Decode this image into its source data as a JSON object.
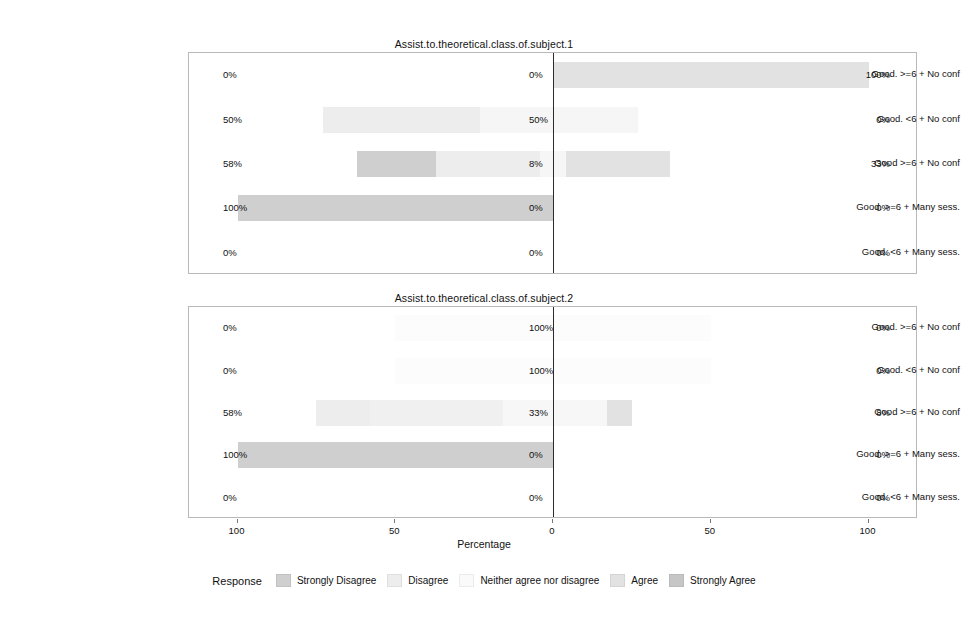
{
  "figure": {
    "axis_title": "Percentage",
    "x_ticks": [
      {
        "label": "100",
        "pos": -100
      },
      {
        "label": "50",
        "pos": -50
      },
      {
        "label": "0",
        "pos": 0
      },
      {
        "label": "50",
        "pos": 50
      },
      {
        "label": "100",
        "pos": 100
      }
    ],
    "xlim": [
      -100,
      100
    ]
  },
  "legend": {
    "title": "Response",
    "items": [
      {
        "label": "Strongly Disagree",
        "color": "#cfcfcf"
      },
      {
        "label": "Disagree",
        "color": "#ededed"
      },
      {
        "label": "Neither agree nor disagree",
        "color": "#fafafa"
      },
      {
        "label": "Agree",
        "color": "#e2e2e2"
      },
      {
        "label": "Strongly Agree",
        "color": "#c6c6c6"
      }
    ]
  },
  "categories": [
    "Good. >=6 + No conf",
    "Good. <6 + No conf",
    "Good >=6 + No conf",
    "Good. >=6 + Many sess.",
    "Good. <6 + Many sess."
  ],
  "chart_data": {
    "type": "bar",
    "subtype": "diverging-stacked-likert",
    "title": "",
    "xlabel": "Percentage",
    "ylabel": "",
    "xlim": [
      -100,
      100
    ],
    "grid": false,
    "legend_position": "bottom",
    "response_levels": [
      "Strongly Disagree",
      "Disagree",
      "Neither agree nor disagree",
      "Agree",
      "Strongly Agree"
    ],
    "panels": [
      {
        "title": "Assist.to.theoretical.class.of.subject.1",
        "categories": [
          "Good. >=6 + No conf",
          "Good. <6 + No conf",
          "Good >=6 + No conf",
          "Good. >=6 + Many sess.",
          "Good. <6 + Many sess."
        ],
        "rows": [
          {
            "category": "Good. >=6 + No conf",
            "left_label": "0%",
            "mid_label": "0%",
            "right_label": "100%",
            "segments": [
              {
                "level": "Strongly Disagree",
                "value": 0,
                "start": 0,
                "end": 0,
                "color": "#cfcfcf"
              },
              {
                "level": "Disagree",
                "value": 0,
                "start": 0,
                "end": 0,
                "color": "#ededed"
              },
              {
                "level": "Neither agree nor disagree",
                "value": 0,
                "start": 0,
                "end": 0,
                "color": "#fafafa"
              },
              {
                "level": "Agree",
                "value": 100,
                "start": 0,
                "end": 100,
                "color": "#e2e2e2"
              },
              {
                "level": "Strongly Agree",
                "value": 0,
                "start": 100,
                "end": 100,
                "color": "#c6c6c6"
              }
            ]
          },
          {
            "category": "Good. <6 + No conf",
            "left_label": "50%",
            "mid_label": "50%",
            "right_label": "0%",
            "segments": [
              {
                "level": "Strongly Disagree",
                "value": 0,
                "start": -73,
                "end": -73,
                "color": "#cfcfcf"
              },
              {
                "level": "Disagree",
                "value": 50,
                "start": -73,
                "end": -23,
                "color": "#ededed"
              },
              {
                "level": "Neither agree nor disagree",
                "value": 50,
                "start": -23,
                "end": 27,
                "color": "#f6f6f6"
              },
              {
                "level": "Agree",
                "value": 0,
                "start": 27,
                "end": 27,
                "color": "#e2e2e2"
              },
              {
                "level": "Strongly Agree",
                "value": 0,
                "start": 27,
                "end": 27,
                "color": "#c6c6c6"
              }
            ]
          },
          {
            "category": "Good >=6 + No conf",
            "left_label": "58%",
            "mid_label": "8%",
            "right_label": "33%",
            "segments": [
              {
                "level": "Strongly Disagree",
                "value": 25,
                "start": -62,
                "end": -37,
                "color": "#cfcfcf"
              },
              {
                "level": "Disagree",
                "value": 33,
                "start": -37,
                "end": -4,
                "color": "#ededed"
              },
              {
                "level": "Neither agree nor disagree",
                "value": 8,
                "start": -4,
                "end": 4,
                "color": "#f6f6f6"
              },
              {
                "level": "Agree",
                "value": 33,
                "start": 4,
                "end": 37,
                "color": "#e2e2e2"
              },
              {
                "level": "Strongly Agree",
                "value": 0,
                "start": 37,
                "end": 37,
                "color": "#c6c6c6"
              }
            ]
          },
          {
            "category": "Good. >=6 + Many sess.",
            "left_label": "100%",
            "mid_label": "0%",
            "right_label": "0%",
            "segments": [
              {
                "level": "Strongly Disagree",
                "value": 100,
                "start": -100,
                "end": 0,
                "color": "#cfcfcf"
              },
              {
                "level": "Disagree",
                "value": 0,
                "start": 0,
                "end": 0,
                "color": "#ededed"
              },
              {
                "level": "Neither agree nor disagree",
                "value": 0,
                "start": 0,
                "end": 0,
                "color": "#f6f6f6"
              },
              {
                "level": "Agree",
                "value": 0,
                "start": 0,
                "end": 0,
                "color": "#e2e2e2"
              },
              {
                "level": "Strongly Agree",
                "value": 0,
                "start": 0,
                "end": 0,
                "color": "#c6c6c6"
              }
            ]
          },
          {
            "category": "Good. <6 + Many sess.",
            "left_label": "0%",
            "mid_label": "0%",
            "right_label": "0%",
            "segments": [
              {
                "level": "Strongly Disagree",
                "value": 0,
                "start": 0,
                "end": 0,
                "color": "#cfcfcf"
              },
              {
                "level": "Disagree",
                "value": 0,
                "start": 0,
                "end": 0,
                "color": "#ededed"
              },
              {
                "level": "Neither agree nor disagree",
                "value": 0,
                "start": 0,
                "end": 0,
                "color": "#f6f6f6"
              },
              {
                "level": "Agree",
                "value": 0,
                "start": 0,
                "end": 0,
                "color": "#e2e2e2"
              },
              {
                "level": "Strongly Agree",
                "value": 0,
                "start": 0,
                "end": 0,
                "color": "#c6c6c6"
              }
            ]
          }
        ]
      },
      {
        "title": "Assist.to.theoretical.class.of.subject.2",
        "categories": [
          "Good. >=6 + No conf",
          "Good. <6 + No conf",
          "Good >=6 + No conf",
          "Good. >=6 + Many sess.",
          "Good. <6 + Many sess."
        ],
        "rows": [
          {
            "category": "Good. >=6 + No conf",
            "left_label": "0%",
            "mid_label": "100%",
            "right_label": "0%",
            "segments": [
              {
                "level": "Strongly Disagree",
                "value": 0,
                "start": -50,
                "end": -50,
                "color": "#cfcfcf"
              },
              {
                "level": "Disagree",
                "value": 0,
                "start": -50,
                "end": -50,
                "color": "#ededed"
              },
              {
                "level": "Neither agree nor disagree",
                "value": 100,
                "start": -50,
                "end": 50,
                "color": "#fcfcfc"
              },
              {
                "level": "Agree",
                "value": 0,
                "start": 50,
                "end": 50,
                "color": "#e2e2e2"
              },
              {
                "level": "Strongly Agree",
                "value": 0,
                "start": 50,
                "end": 50,
                "color": "#c6c6c6"
              }
            ]
          },
          {
            "category": "Good. <6 + No conf",
            "left_label": "0%",
            "mid_label": "100%",
            "right_label": "0%",
            "segments": [
              {
                "level": "Strongly Disagree",
                "value": 0,
                "start": -50,
                "end": -50,
                "color": "#cfcfcf"
              },
              {
                "level": "Disagree",
                "value": 0,
                "start": -50,
                "end": -50,
                "color": "#ededed"
              },
              {
                "level": "Neither agree nor disagree",
                "value": 100,
                "start": -50,
                "end": 50,
                "color": "#fcfcfc"
              },
              {
                "level": "Agree",
                "value": 0,
                "start": 50,
                "end": 50,
                "color": "#e2e2e2"
              },
              {
                "level": "Strongly Agree",
                "value": 0,
                "start": 50,
                "end": 50,
                "color": "#c6c6c6"
              }
            ]
          },
          {
            "category": "Good >=6 + No conf",
            "left_label": "58%",
            "mid_label": "33%",
            "right_label": "8%",
            "segments": [
              {
                "level": "Strongly Disagree",
                "value": 17,
                "start": -75,
                "end": -58,
                "color": "#ededed"
              },
              {
                "level": "Disagree",
                "value": 42,
                "start": -58,
                "end": -16,
                "color": "#f0f0f0"
              },
              {
                "level": "Neither agree nor disagree",
                "value": 33,
                "start": -16,
                "end": 17,
                "color": "#f7f7f7"
              },
              {
                "level": "Agree",
                "value": 8,
                "start": 17,
                "end": 25,
                "color": "#e2e2e2"
              },
              {
                "level": "Strongly Agree",
                "value": 0,
                "start": 25,
                "end": 25,
                "color": "#c6c6c6"
              }
            ]
          },
          {
            "category": "Good. >=6 + Many sess.",
            "left_label": "100%",
            "mid_label": "0%",
            "right_label": "0%",
            "segments": [
              {
                "level": "Strongly Disagree",
                "value": 100,
                "start": -100,
                "end": 0,
                "color": "#cfcfcf"
              },
              {
                "level": "Disagree",
                "value": 0,
                "start": 0,
                "end": 0,
                "color": "#ededed"
              },
              {
                "level": "Neither agree nor disagree",
                "value": 0,
                "start": 0,
                "end": 0,
                "color": "#f6f6f6"
              },
              {
                "level": "Agree",
                "value": 0,
                "start": 0,
                "end": 0,
                "color": "#e2e2e2"
              },
              {
                "level": "Strongly Agree",
                "value": 0,
                "start": 0,
                "end": 0,
                "color": "#c6c6c6"
              }
            ]
          },
          {
            "category": "Good. <6 + Many sess.",
            "left_label": "0%",
            "mid_label": "0%",
            "right_label": "0%",
            "segments": [
              {
                "level": "Strongly Disagree",
                "value": 0,
                "start": 0,
                "end": 0,
                "color": "#cfcfcf"
              },
              {
                "level": "Disagree",
                "value": 0,
                "start": 0,
                "end": 0,
                "color": "#ededed"
              },
              {
                "level": "Neither agree nor disagree",
                "value": 0,
                "start": 0,
                "end": 0,
                "color": "#f6f6f6"
              },
              {
                "level": "Agree",
                "value": 0,
                "start": 0,
                "end": 0,
                "color": "#e2e2e2"
              },
              {
                "level": "Strongly Agree",
                "value": 0,
                "start": 0,
                "end": 0,
                "color": "#c6c6c6"
              }
            ]
          }
        ]
      }
    ]
  }
}
